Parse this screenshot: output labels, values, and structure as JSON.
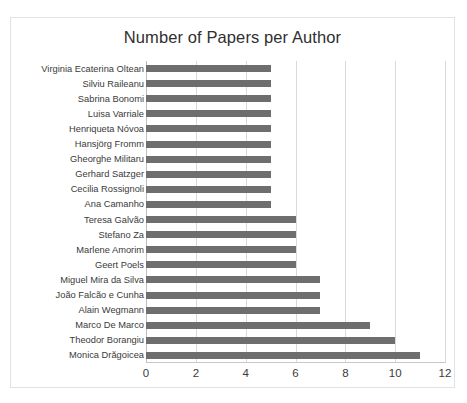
{
  "chart_data": {
    "type": "bar",
    "orientation": "horizontal",
    "title": "Number of Papers per Author",
    "xlabel": "",
    "ylabel": "",
    "xlim": [
      0,
      12
    ],
    "xticks": [
      0,
      2,
      4,
      6,
      8,
      10,
      12
    ],
    "xtick_labels": [
      "0",
      "2",
      "4",
      "6",
      "8",
      "10",
      "12"
    ],
    "grid": true,
    "legend": false,
    "bar_color": "#6e6e6e",
    "gridline_color": "#d9d9d9",
    "background_color": "#ffffff",
    "border_color": "#e2e2e2",
    "categories": [
      "Virginia Ecaterina Oltean",
      "Silviu Raileanu",
      "Sabrina Bonomi",
      "Luisa Varriale",
      "Henriqueta Nóvoa",
      "Hansjörg Fromm",
      "Gheorghe Militaru",
      "Gerhard Satzger",
      "Cecilia Rossignoli",
      "Ana Camanho",
      "Teresa Galvão",
      "Stefano Za",
      "Marlene Amorim",
      "Geert Poels",
      "Miguel Mira da Silva",
      "João Falcão e Cunha",
      "Alain Wegmann",
      "Marco De Marco",
      "Theodor Borangiu",
      "Monica Drăgoicea"
    ],
    "values": [
      5,
      5,
      5,
      5,
      5,
      5,
      5,
      5,
      5,
      5,
      6,
      6,
      6,
      6,
      7,
      7,
      7,
      9,
      10,
      11
    ]
  }
}
